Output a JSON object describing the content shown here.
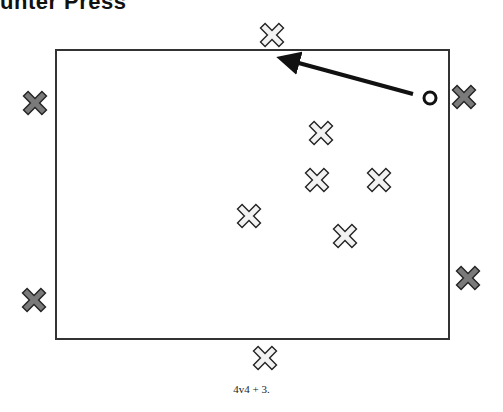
{
  "title": "unter Press",
  "caption": "4v4 + 3.",
  "colors": {
    "field_line": "#333333",
    "attacker_fill": "#f2f2f2",
    "neutral_fill": "#7a7a7a",
    "marker_outline": "#222222",
    "arrow": "#111111"
  },
  "field": {
    "x": 56,
    "y": 50,
    "width": 393,
    "height": 289
  },
  "players": {
    "light": [
      {
        "id": "light-top-boundary",
        "x": 272,
        "y": 35
      },
      {
        "id": "light-1",
        "x": 321,
        "y": 133
      },
      {
        "id": "light-2",
        "x": 317,
        "y": 180
      },
      {
        "id": "light-3",
        "x": 379,
        "y": 180
      },
      {
        "id": "light-4",
        "x": 249,
        "y": 216
      },
      {
        "id": "light-5",
        "x": 345,
        "y": 236
      },
      {
        "id": "light-bottom-boundary",
        "x": 265,
        "y": 358
      }
    ],
    "dark": [
      {
        "id": "dark-left-top",
        "x": 35,
        "y": 103
      },
      {
        "id": "dark-left-bottom",
        "x": 34,
        "y": 300
      },
      {
        "id": "dark-right-top",
        "x": 464,
        "y": 97
      },
      {
        "id": "dark-right-bottom",
        "x": 468,
        "y": 278
      }
    ]
  },
  "ball": {
    "x": 430,
    "y": 98,
    "r": 6
  },
  "arrow": {
    "x1": 413,
    "y1": 94,
    "x2": 284,
    "y2": 59
  }
}
